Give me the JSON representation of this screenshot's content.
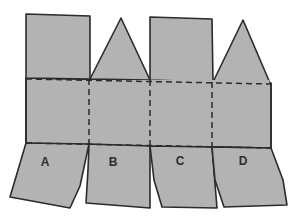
{
  "diagram": {
    "type": "paper net / fold template",
    "colors": {
      "fill": "#b3b3b3",
      "stroke": "#2b2b2b",
      "background": "#ffffff"
    },
    "top_pieces": [
      {
        "name": "A-top",
        "shape": "rectangle"
      },
      {
        "name": "B-top",
        "shape": "triangle"
      },
      {
        "name": "C-top",
        "shape": "rectangle"
      },
      {
        "name": "D-top",
        "shape": "triangle"
      }
    ],
    "fold_lines": [
      {
        "orientation": "horizontal",
        "position": "upper"
      },
      {
        "orientation": "horizontal",
        "position": "lower"
      },
      {
        "orientation": "vertical",
        "between": "A-B"
      },
      {
        "orientation": "vertical",
        "between": "B-C"
      },
      {
        "orientation": "vertical",
        "between": "C-D"
      }
    ],
    "flaps": [
      {
        "label": "A"
      },
      {
        "label": "B"
      },
      {
        "label": "C"
      },
      {
        "label": "D"
      }
    ]
  }
}
